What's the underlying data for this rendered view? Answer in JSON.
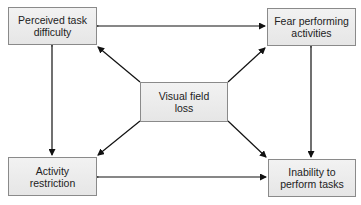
{
  "diagram": {
    "nodes": [
      {
        "id": "perceived",
        "label_line1": "Perceived task",
        "label_line2": "difficulty"
      },
      {
        "id": "fear",
        "label_line1": "Fear performing",
        "label_line2": "activities"
      },
      {
        "id": "visual",
        "label_line1": "Visual field",
        "label_line2": "loss"
      },
      {
        "id": "restriction",
        "label_line1": "Activity",
        "label_line2": "restriction"
      },
      {
        "id": "inability",
        "label_line1": "Inability to",
        "label_line2": "perform tasks"
      }
    ],
    "edges": [
      {
        "from": "perceived",
        "to": "fear",
        "type": "bidirectional"
      },
      {
        "from": "restriction",
        "to": "inability",
        "type": "bidirectional"
      },
      {
        "from": "perceived",
        "to": "restriction",
        "type": "bidirectional"
      },
      {
        "from": "fear",
        "to": "inability",
        "type": "bidirectional"
      },
      {
        "from": "visual",
        "to": "perceived",
        "type": "directed"
      },
      {
        "from": "visual",
        "to": "fear",
        "type": "directed"
      },
      {
        "from": "visual",
        "to": "restriction",
        "type": "directed"
      },
      {
        "from": "visual",
        "to": "inability",
        "type": "directed"
      }
    ]
  }
}
